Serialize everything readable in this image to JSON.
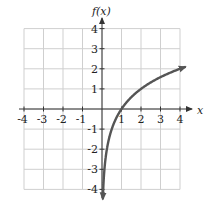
{
  "chart_data": {
    "type": "line",
    "title": "",
    "xlabel": "x",
    "ylabel": "f(x)",
    "xlim": [
      -4,
      4
    ],
    "ylim": [
      -4,
      4
    ],
    "grid": true,
    "x_ticks": [
      "-4",
      "-3",
      "-2",
      "-1",
      "1",
      "2",
      "3",
      "4"
    ],
    "y_ticks": [
      "4",
      "3",
      "2",
      "1",
      "-1",
      "-2",
      "-3",
      "-4"
    ],
    "series": [
      {
        "name": "f(x)",
        "function": "log2(x)",
        "x": [
          0.0625,
          0.125,
          0.25,
          0.5,
          1,
          2,
          3,
          4
        ],
        "y": [
          -4,
          -3,
          -2,
          -1,
          0,
          1,
          1.585,
          2
        ],
        "color": "#555555",
        "arrows": "both ends"
      }
    ]
  },
  "colors": {
    "grid": "#cfcfcf",
    "axis": "#333333",
    "curve": "#555555",
    "text": "#222222"
  }
}
